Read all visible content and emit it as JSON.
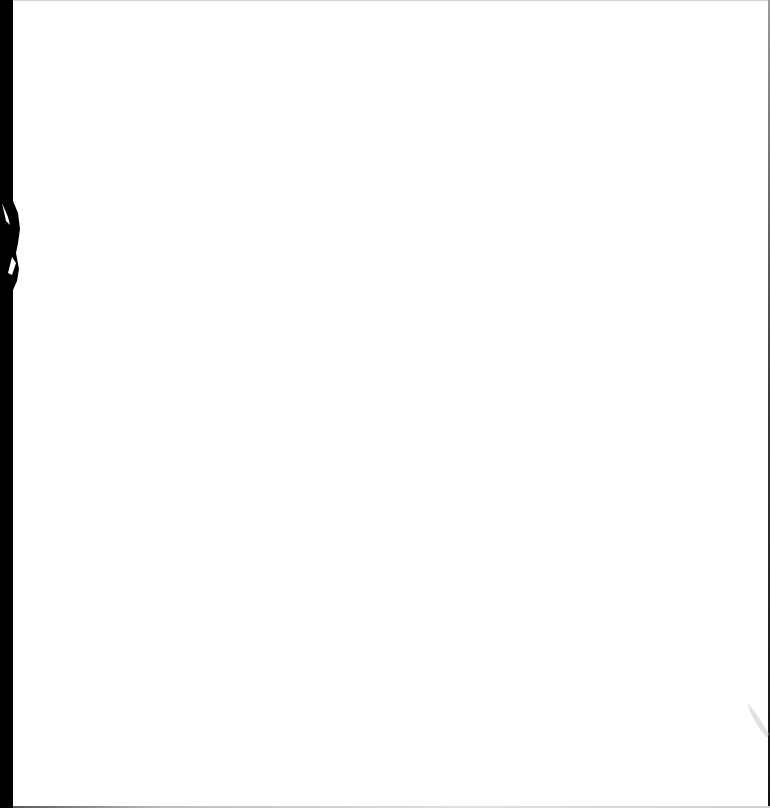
{
  "document": {
    "type": "blank-scanned-page",
    "text": "",
    "colors": {
      "paper": "#ffffff",
      "edge": "#000000",
      "border": "#3a3a3a"
    }
  },
  "decorations": {
    "left_edge_icon": "scan-edge-shadow",
    "smudge_icon": "scan-smudge"
  }
}
